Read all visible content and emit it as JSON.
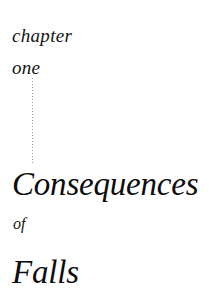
{
  "page": {
    "background_color": "#ffffff",
    "text_color": "#111111"
  },
  "chapter_label": {
    "word_chapter": "chapter",
    "word_number": "one"
  },
  "divider": {
    "style": "vertical-dotted-rule",
    "color": "#9a9a9a"
  },
  "title": {
    "line_1": "Consequences",
    "line_2": "of",
    "line_3": "Falls"
  }
}
